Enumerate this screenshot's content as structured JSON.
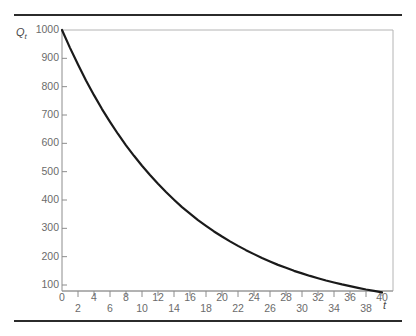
{
  "chart_data": {
    "type": "line",
    "title": "",
    "xlabel": "t",
    "ylabel": "Q_t",
    "ylabel_base": "Q",
    "ylabel_sub": "t",
    "xlim": [
      0,
      41
    ],
    "ylim": [
      0,
      1030
    ],
    "grid": false,
    "legend": "none",
    "curve_color": "#1a1a1a",
    "frame_color": "#b4b4b4",
    "axis_color": "#8c8c8c",
    "rule_color": "#2b2b2b",
    "x_ticks": [
      0,
      2,
      4,
      6,
      8,
      10,
      12,
      14,
      16,
      18,
      20,
      22,
      24,
      26,
      28,
      30,
      32,
      34,
      36,
      38,
      40
    ],
    "x_tick_labels_upper": [
      "0",
      "4",
      "8",
      "12",
      "16",
      "20",
      "24",
      "28",
      "32",
      "36",
      "40"
    ],
    "x_tick_labels_lower": [
      "2",
      "6",
      "10",
      "14",
      "18",
      "22",
      "26",
      "30",
      "34",
      "38"
    ],
    "y_ticks": [
      100,
      200,
      300,
      400,
      500,
      600,
      700,
      800,
      900,
      1000
    ],
    "y_tick_labels": [
      "100",
      "200",
      "300",
      "400",
      "500",
      "600",
      "700",
      "800",
      "900",
      "1000"
    ],
    "series": [
      {
        "name": "Q_t",
        "x": [
          0,
          1,
          2,
          3,
          4,
          5,
          6,
          7,
          8,
          9,
          10,
          11,
          12,
          13,
          14,
          15,
          16,
          17,
          18,
          19,
          20,
          21,
          22,
          23,
          24,
          25,
          26,
          27,
          28,
          29,
          30,
          31,
          32,
          33,
          34,
          35,
          36,
          37,
          38,
          39,
          40
        ],
        "values": [
          1000,
          937,
          878,
          822,
          770,
          721,
          676,
          633,
          593,
          556,
          521,
          488,
          457,
          428,
          401,
          375,
          352,
          329,
          309,
          289,
          271,
          254,
          238,
          223,
          209,
          195,
          183,
          171,
          161,
          150,
          141,
          132,
          124,
          116,
          109,
          102,
          96,
          90,
          84,
          79,
          74
        ]
      }
    ]
  }
}
